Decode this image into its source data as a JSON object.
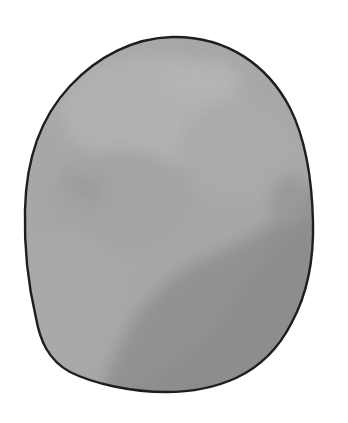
{
  "illustration": {
    "subject": "stone",
    "colors": {
      "background": "#ffffff",
      "outline": "#1e1e1e",
      "fill_light": "#adadad",
      "fill_mid": "#a0a0a0",
      "fill_dark": "#8e8e8e"
    }
  }
}
